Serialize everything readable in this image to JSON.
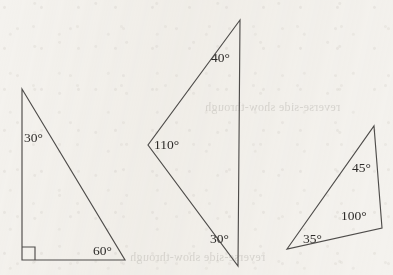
{
  "figure": {
    "background_color": "#f4f2ee",
    "line_color": "#4e4c4a",
    "text_color": "#2d2b29",
    "degree_symbol": "°",
    "ghost_showthrough": {
      "line_top": "reverse-side show-through",
      "line_bottom": "reverse-side show-through"
    }
  },
  "shapes": [
    {
      "id": "triangle-left",
      "name": "right-triangle",
      "points": "22,89 22,260 125,260",
      "has_right_angle_mark": true,
      "right_angle_mark_path": "M22,247 L35,247 L35,260",
      "angles": [
        {
          "name": "angle-30-left-apex",
          "value": "30",
          "x": 24,
          "y": 131
        },
        {
          "name": "angle-60-left-bottomright",
          "value": "60",
          "x": 93,
          "y": 244
        }
      ]
    },
    {
      "id": "triangle-middle",
      "name": "obtuse-triangle",
      "points": "240,20 148,145 238,266",
      "has_right_angle_mark": false,
      "right_angle_mark_path": "",
      "angles": [
        {
          "name": "angle-40-middle-top",
          "value": "40",
          "x": 211,
          "y": 51
        },
        {
          "name": "angle-110-middle-left",
          "value": "110",
          "x": 154,
          "y": 138
        },
        {
          "name": "angle-30-middle-bottom",
          "value": "30",
          "x": 210,
          "y": 232
        }
      ]
    },
    {
      "id": "triangle-right",
      "name": "obtuse-triangle",
      "points": "374,126 382,228 287,249",
      "has_right_angle_mark": false,
      "right_angle_mark_path": "",
      "angles": [
        {
          "name": "angle-45-right-top",
          "value": "45",
          "x": 352,
          "y": 161
        },
        {
          "name": "angle-100-right-bottomright",
          "value": "100",
          "x": 341,
          "y": 209
        },
        {
          "name": "angle-35-right-bottomleft",
          "value": "35",
          "x": 303,
          "y": 232
        }
      ]
    }
  ]
}
